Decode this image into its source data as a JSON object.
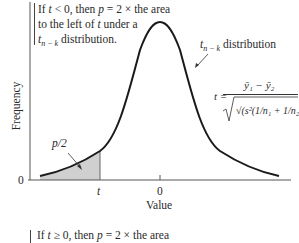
{
  "top_note": {
    "line1_prefix": "If ",
    "line1_var": "t",
    "line1_mid": " < 0, then ",
    "line1_p": "p",
    "line1_suffix": " = 2 × the area",
    "line2": "to the left of ",
    "line2_var": "t",
    "line2_suffix": " under a",
    "line3_var": "t",
    "line3_sub": "n − k",
    "line3_suffix": " distribution."
  },
  "curve_label": {
    "var": "t",
    "sub": "n − k",
    "suffix": " distribution"
  },
  "formula": {
    "lhs": "t =",
    "numerator": "ȳ₁ − ȳ₂",
    "denominator": "√(s²(1/n₁ + 1/n₂))"
  },
  "shaded_label": "p/2",
  "axes": {
    "ylabel": "Frequency",
    "xlabel": "Value",
    "y_zero_tick": "0",
    "x_ticks": [
      {
        "label": "t",
        "italic": true
      },
      {
        "label": "0",
        "italic": false
      }
    ]
  },
  "bottom_note": {
    "prefix": "If ",
    "var": "t",
    "mid": " ≥ 0, then ",
    "p": "p",
    "suffix": " = 2 × the area"
  },
  "colors": {
    "curve": "#1a1a1a",
    "shade": "#d0d0d0",
    "axis": "#555555"
  }
}
